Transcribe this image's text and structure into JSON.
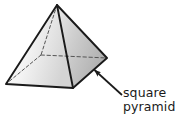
{
  "figure": {
    "kind": "geometric-solid-illustration",
    "solid_name": "square pyramid",
    "background_color": "#ffffff",
    "outline_color": "#1a1a1a",
    "hidden_edge_style": "dashed",
    "label": {
      "line1": "square",
      "line2": "pyramid",
      "text_color": "#1a1a1a"
    },
    "faces": {
      "front_left_label": "front-left lateral face",
      "front_left_fill_light": "#fafafa",
      "front_left_fill_dark": "#d6d6d6",
      "front_right_label": "front-right lateral face",
      "front_right_fill_light": "#e8e8e8",
      "front_right_fill_dark": "#b0b0b0",
      "base_label": "square base (hidden)"
    },
    "vertices": {
      "apex": "57,5",
      "left": "6,84",
      "front": "73,88",
      "right": "107,58",
      "back_hidden": "41,55"
    },
    "callout_arrow": {
      "name": "callout-arrow",
      "tail": "122,95",
      "tip": "92,68",
      "color": "#1a1a1a"
    }
  }
}
